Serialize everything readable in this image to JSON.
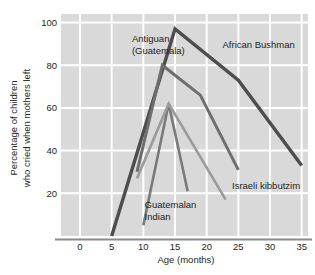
{
  "chart_data": {
    "type": "line",
    "title": "",
    "xlabel": "Age (months)",
    "ylabel": "Percentage of children who cried when mothers left",
    "ylabel_line1": "Percentage of children",
    "ylabel_line2": "who cried when mothers left",
    "xlim": [
      -3,
      36
    ],
    "ylim": [
      0,
      104
    ],
    "xticks": [
      0,
      5,
      10,
      15,
      20,
      25,
      30,
      35
    ],
    "xticklabels": [
      "0",
      "5",
      "10",
      "15",
      "20",
      "25",
      "30",
      "35"
    ],
    "yticks": [
      20,
      40,
      60,
      80,
      100
    ],
    "yticklabels": [
      "20",
      "40",
      "60",
      "80",
      "100"
    ],
    "grid": true,
    "grid_color": "#ffffff",
    "plot_background": "#d9d9d9",
    "legend_position": "inline-annotations",
    "series": [
      {
        "name": "African Bushman",
        "color": "#4d4d4d",
        "width": 3.4,
        "label_x": 22.5,
        "label_y": 88,
        "x": [
          5,
          15,
          25,
          35
        ],
        "y": [
          0,
          97,
          73,
          33
        ]
      },
      {
        "name": "Antiguan (Guatemala)",
        "label_line1": "Antiguan",
        "label_line2": "(Guatemala)",
        "color": "#6e6e6e",
        "width": 3.0,
        "label_x": 8.2,
        "label_y": 91,
        "x": [
          9,
          13,
          19,
          25
        ],
        "y": [
          30,
          80,
          66,
          31
        ]
      },
      {
        "name": "Guatemalan Indian",
        "label_line1": "Guatemalan",
        "label_line2": "Indian",
        "color": "#7a7a7a",
        "width": 2.6,
        "label_x": 10.2,
        "label_y": 13,
        "x": [
          10,
          14,
          17,
          17
        ],
        "y": [
          5,
          62,
          21,
          21
        ]
      },
      {
        "name": "Israeli kibbutzim",
        "color": "#9b9b9b",
        "width": 2.6,
        "label_x": 24.0,
        "label_y": 22,
        "x": [
          9,
          14,
          23
        ],
        "y": [
          27,
          62,
          17
        ]
      }
    ]
  }
}
